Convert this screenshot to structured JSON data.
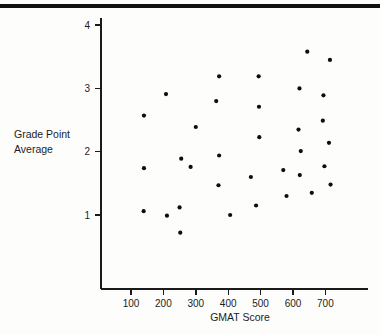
{
  "figure": {
    "background_color": "#fdfdfc",
    "rule_color": "#111111",
    "marker_color": "#0d0d0d"
  },
  "axis": {
    "y_title_line1": "Grade Point",
    "y_title_line2": "Average",
    "x_title": "GMAT Score",
    "y_ticks": [
      "1",
      "2",
      "3",
      "4"
    ],
    "x_ticks": [
      "100",
      "200",
      "300",
      "400",
      "500",
      "600",
      "700"
    ]
  },
  "chart_data": {
    "type": "scatter",
    "title": "",
    "xlabel": "GMAT Score",
    "ylabel": "Grade Point Average",
    "xlim": [
      40,
      780
    ],
    "ylim": [
      0.35,
      4.3
    ],
    "grid": false,
    "legend": null,
    "xticks": [
      100,
      200,
      300,
      400,
      500,
      600,
      700
    ],
    "yticks": [
      1,
      2,
      3,
      4
    ],
    "points": [
      [
        140,
        2.57
      ],
      [
        140,
        1.74
      ],
      [
        139,
        1.06
      ],
      [
        208,
        2.91
      ],
      [
        211,
        0.99
      ],
      [
        250,
        1.12
      ],
      [
        252,
        0.72
      ],
      [
        255,
        1.89
      ],
      [
        300,
        2.39
      ],
      [
        284,
        1.76
      ],
      [
        363,
        2.8
      ],
      [
        372,
        3.19
      ],
      [
        372,
        1.94
      ],
      [
        370,
        1.47
      ],
      [
        406,
        1.0
      ],
      [
        470,
        1.6
      ],
      [
        494,
        3.19
      ],
      [
        495,
        2.71
      ],
      [
        496,
        2.23
      ],
      [
        486,
        1.15
      ],
      [
        570,
        1.71
      ],
      [
        580,
        1.3
      ],
      [
        617,
        2.35
      ],
      [
        620,
        3.0
      ],
      [
        621,
        1.63
      ],
      [
        624,
        2.01
      ],
      [
        644,
        3.58
      ],
      [
        658,
        1.35
      ],
      [
        692,
        2.49
      ],
      [
        694,
        2.89
      ],
      [
        697,
        1.77
      ],
      [
        711,
        2.14
      ],
      [
        714,
        3.45
      ],
      [
        716,
        1.48
      ]
    ]
  }
}
